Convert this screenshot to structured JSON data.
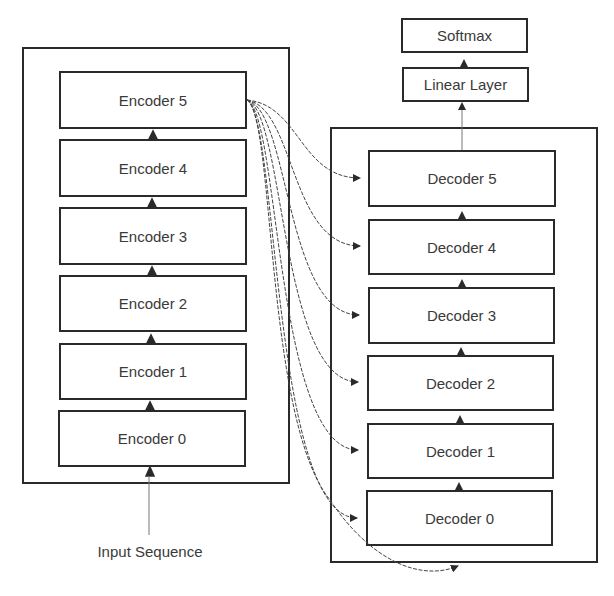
{
  "diagram": {
    "encoder_stack": {
      "blocks": [
        {
          "label": "Encoder 5"
        },
        {
          "label": "Encoder 4"
        },
        {
          "label": "Encoder 3"
        },
        {
          "label": "Encoder 2"
        },
        {
          "label": "Encoder 1"
        },
        {
          "label": "Encoder 0"
        }
      ],
      "input_label": "Input Sequence"
    },
    "decoder_stack": {
      "blocks": [
        {
          "label": "Decoder 5"
        },
        {
          "label": "Decoder 4"
        },
        {
          "label": "Decoder 3"
        },
        {
          "label": "Decoder 2"
        },
        {
          "label": "Decoder 1"
        },
        {
          "label": "Decoder 0"
        }
      ]
    },
    "output_head": {
      "linear_label": "Linear Layer",
      "softmax_label": "Softmax"
    },
    "colors": {
      "stroke": "#2a2a2a",
      "text": "#3a3a3a",
      "background": "#ffffff"
    }
  }
}
